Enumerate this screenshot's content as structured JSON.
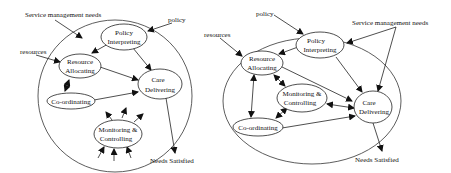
{
  "diagrams": [
    {
      "id": "left",
      "inputs": {
        "service_needs": "Service management needs",
        "policy": "policy",
        "resources": "resources"
      },
      "output": "Needs Satisfied",
      "nodes": {
        "policy": [
          "Policy",
          "Interpreting"
        ],
        "resource": [
          "Resource",
          "Allocating"
        ],
        "care": [
          "Care",
          "Delivering"
        ],
        "coord": [
          "Co-ordinating"
        ],
        "monitor": [
          "Monitoring &",
          "Controlling"
        ]
      }
    },
    {
      "id": "right",
      "inputs": {
        "service_needs": "Service management needs",
        "policy": "policy",
        "resources": "resources"
      },
      "output": "Needs Satisfied",
      "nodes": {
        "policy": [
          "Policy",
          "Interpreting"
        ],
        "resource": [
          "Resource",
          "Allocating"
        ],
        "care": [
          "Care",
          "Delivering"
        ],
        "coord": [
          "Co-ordinating"
        ],
        "monitor": [
          "Monitoring &",
          "Controlling"
        ]
      }
    }
  ],
  "colors": {
    "stroke": "#222222",
    "background": "#ffffff"
  }
}
